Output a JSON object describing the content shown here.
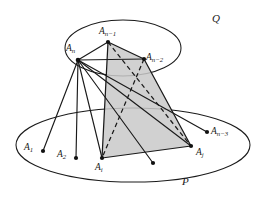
{
  "figure": {
    "background_color": "#ffffff",
    "stroke_color": "#1a1a1a",
    "shade_fill": "#c9c9c9",
    "shade_opacity": 0.85
  },
  "planes": [
    {
      "id": "Q",
      "label": "Q",
      "position": "upper",
      "label_x": 212,
      "label_y": 13
    },
    {
      "id": "P",
      "label": "P",
      "position": "lower",
      "label_x": 182,
      "label_y": 176
    }
  ],
  "points": [
    {
      "id": "A1",
      "base": "A",
      "sub": "1",
      "x": 43,
      "y": 151,
      "label_x": 24,
      "label_y": 143,
      "plane": "P"
    },
    {
      "id": "A2",
      "base": "A",
      "sub": "2",
      "x": 76,
      "y": 158,
      "label_x": 57,
      "label_y": 150,
      "plane": "P"
    },
    {
      "id": "Ai",
      "base": "A",
      "sub": "i",
      "x": 102,
      "y": 158,
      "label_x": 95,
      "label_y": 163,
      "plane": "P"
    },
    {
      "id": "Aj",
      "base": "A",
      "sub": "j",
      "x": 191,
      "y": 146,
      "label_x": 196,
      "label_y": 148,
      "plane": "P"
    },
    {
      "id": "An3",
      "base": "A",
      "sub": "n−3",
      "x": 207,
      "y": 132,
      "label_x": 211,
      "label_y": 127,
      "plane": "P"
    },
    {
      "id": "An2",
      "base": "A",
      "sub": "n−2",
      "x": 144,
      "y": 59,
      "label_x": 146,
      "label_y": 53,
      "plane": "Q"
    },
    {
      "id": "An1",
      "base": "A",
      "sub": "n−1",
      "x": 108,
      "y": 42,
      "label_x": 99,
      "label_y": 27,
      "plane": "Q"
    },
    {
      "id": "An",
      "base": "A",
      "sub": "n",
      "x": 78,
      "y": 60,
      "label_x": 66,
      "label_y": 44,
      "plane": "Q"
    },
    {
      "id": "Ufree",
      "base": "",
      "sub": "",
      "x": 153,
      "y": 163,
      "label_x": 0,
      "label_y": 0,
      "plane": "P"
    }
  ],
  "shaded_polygon": {
    "name": "quadrilateral-An1-An2-Aj-Ai",
    "vertices": [
      "An1",
      "An2",
      "Aj",
      "Ai"
    ]
  },
  "solid_edges": [
    [
      "An1",
      "An2"
    ],
    [
      "An2",
      "Aj"
    ],
    [
      "Aj",
      "Ai"
    ],
    [
      "Ai",
      "An1"
    ],
    [
      "An",
      "An1"
    ],
    [
      "An",
      "An2"
    ],
    [
      "An",
      "Ai"
    ],
    [
      "An",
      "Aj"
    ],
    [
      "An",
      "A1"
    ],
    [
      "An",
      "A2"
    ],
    [
      "An",
      "An3"
    ],
    [
      "An",
      "Ufree"
    ]
  ],
  "dashed_edges": [
    [
      "An1",
      "Aj"
    ],
    [
      "An2",
      "Ai"
    ]
  ],
  "legend": {
    "solid": "solid segment",
    "dashed": "hidden segment",
    "shaded": "polygon face"
  }
}
